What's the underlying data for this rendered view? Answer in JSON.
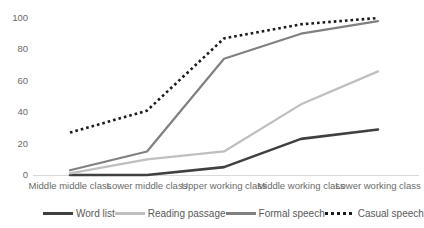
{
  "chart_data": {
    "type": "line",
    "title": "",
    "subtitle": "",
    "xlabel": "",
    "ylabel": "",
    "ylim": [
      0,
      100
    ],
    "yticks": [
      0,
      20,
      40,
      60,
      80,
      100
    ],
    "grid": false,
    "legend_position": "bottom",
    "categories": [
      "Middle middle class",
      "Lower middle class",
      "Upper working class",
      "Middle working class",
      "Lower working class"
    ],
    "series": [
      {
        "name": "Word list",
        "values": [
          0,
          0,
          5,
          23,
          29
        ],
        "color": "#404040",
        "style": "solid",
        "width": 2.6
      },
      {
        "name": "Reading passage",
        "values": [
          1,
          10,
          15,
          45,
          66
        ],
        "color": "#bfbfbf",
        "style": "solid",
        "width": 2.2
      },
      {
        "name": "Formal speech",
        "values": [
          3,
          15,
          74,
          90,
          98
        ],
        "color": "#808080",
        "style": "solid",
        "width": 2.2
      },
      {
        "name": "Casual speech",
        "values": [
          27,
          41,
          87,
          96,
          100
        ],
        "color": "#1a1a1a",
        "style": "dotted",
        "width": 2.6
      }
    ]
  },
  "axis": {
    "y_tick_labels": [
      "100",
      "80",
      "60",
      "40",
      "20",
      "0"
    ],
    "baseline_color": "#d9d9d9"
  },
  "legend": {
    "items": [
      {
        "label": "Word list",
        "color": "#404040",
        "style": "solid"
      },
      {
        "label": "Reading passage",
        "color": "#bfbfbf",
        "style": "solid"
      },
      {
        "label": "Formal speech",
        "color": "#808080",
        "style": "solid"
      },
      {
        "label": "Casual speech",
        "color": "#1a1a1a",
        "style": "dotted"
      }
    ]
  }
}
